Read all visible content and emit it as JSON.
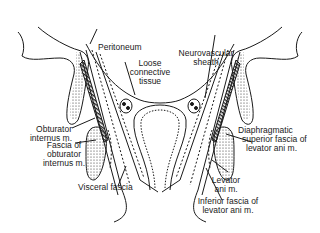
{
  "diagram": {
    "colors": {
      "ink": "#1a1a1a",
      "background": "#ffffff"
    },
    "labels": {
      "peritoneum": "Peritoneum",
      "loose_connective_tissue": [
        "Loose",
        "connective",
        "tissue"
      ],
      "neurovascular_sheath": [
        "Neurovascular",
        "sheath"
      ],
      "obturator_internus": [
        "Obturator",
        "internus m."
      ],
      "fascia_obturator_internus": [
        "Fascia of",
        "obturator",
        "internus m."
      ],
      "visceral_fascia": "Visceral fascia",
      "diaphragmatic_superior_fascia": [
        "Diaphragmatic",
        "superior fascia of",
        "levator ani m."
      ],
      "levator_ani": [
        "Levator",
        "ani m."
      ],
      "inferior_fascia_levator": [
        "Inferior fascia of",
        "levator ani m."
      ]
    }
  }
}
